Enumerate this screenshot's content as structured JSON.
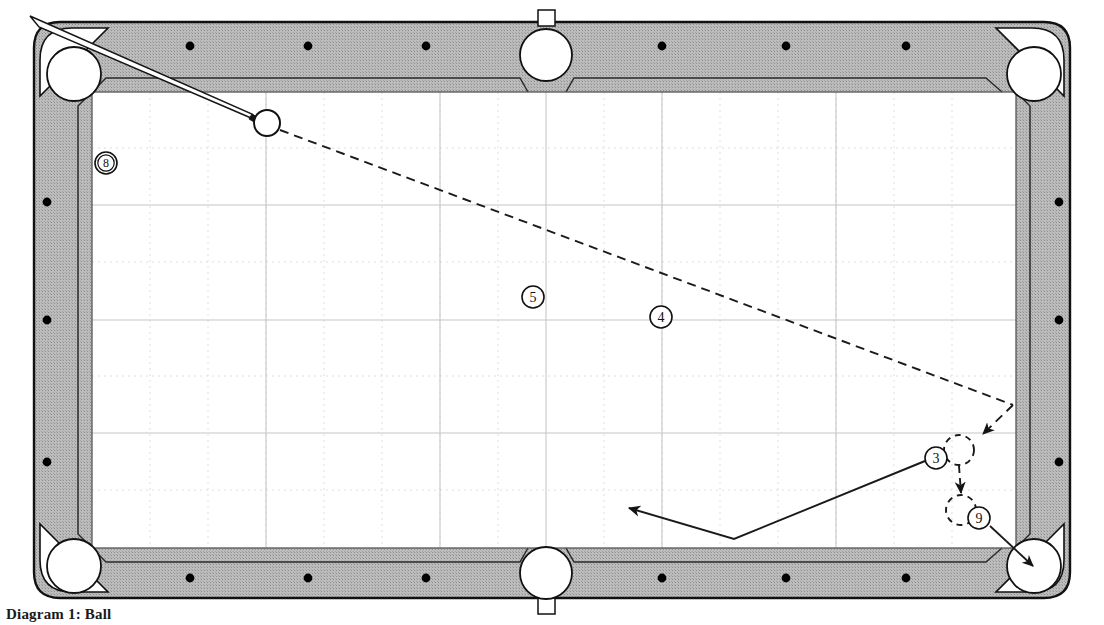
{
  "figure": {
    "caption": "Diagram 1: Ball",
    "kind": "pool-table-shot-diagram"
  },
  "colors": {
    "rail": "#b4b4b4",
    "rail_dark": "#9a9a9a",
    "outline": "#101010",
    "cloth": "#ffffff",
    "grid_major": "#c9c9c9",
    "grid_minor": "#dcdcdc",
    "path_solid": "#1a1a1a",
    "path_dashed": "#1a1a1a",
    "ball_fill": "#ffffff",
    "diamond": "#000000"
  },
  "table": {
    "name": "pool-table",
    "rail_diamonds_top": 6,
    "rail_diamonds_bottom": 6,
    "rail_diamonds_left": 3,
    "rail_diamonds_right": 3,
    "pockets": [
      {
        "id": "top-left",
        "label": "top-left-pocket",
        "cx": 74,
        "cy": 74
      },
      {
        "id": "top-middle",
        "label": "top-middle-pocket",
        "cx": 546,
        "cy": 55
      },
      {
        "id": "top-right",
        "label": "top-right-pocket",
        "cx": 1034,
        "cy": 74
      },
      {
        "id": "bottom-left",
        "label": "bottom-left-pocket",
        "cx": 74,
        "cy": 566
      },
      {
        "id": "bottom-middle",
        "label": "bottom-middle-pocket",
        "cx": 546,
        "cy": 573
      },
      {
        "id": "bottom-right",
        "label": "bottom-right-pocket",
        "cx": 1034,
        "cy": 566
      }
    ]
  },
  "balls": [
    {
      "id": "cue",
      "label": "",
      "name": "cue-ball",
      "cx": 267,
      "cy": 123,
      "r": 13,
      "style": "solid-open"
    },
    {
      "id": "8",
      "label": "8",
      "name": "ball-label-8",
      "cx": 106,
      "cy": 163,
      "r": 11,
      "style": "numbered"
    },
    {
      "id": "5",
      "label": "5",
      "name": "ball-label-5",
      "cx": 533,
      "cy": 297,
      "r": 11,
      "style": "numbered"
    },
    {
      "id": "4",
      "label": "4",
      "name": "ball-label-4",
      "cx": 661,
      "cy": 317,
      "r": 11,
      "style": "numbered"
    },
    {
      "id": "3",
      "label": "3",
      "name": "ball-label-3",
      "cx": 936,
      "cy": 458,
      "r": 11,
      "style": "numbered"
    },
    {
      "id": "9",
      "label": "9",
      "name": "ball-label-9",
      "cx": 979,
      "cy": 518,
      "r": 11,
      "style": "numbered"
    }
  ],
  "ghost_balls": [
    {
      "name": "ghost-ball-3-contact",
      "cx": 959,
      "cy": 450,
      "r": 15
    },
    {
      "name": "ghost-ball-3-landing",
      "cx": 961,
      "cy": 510,
      "r": 15
    }
  ],
  "cue_stick": {
    "name": "cue-stick",
    "butt_x": 34,
    "butt_y": 20,
    "tip_x": 252,
    "tip_y": 117,
    "butt_width": 11,
    "tip_width": 3
  },
  "paths": {
    "cue_ball_dashed": {
      "name": "cue-ball-path",
      "style": "dashed",
      "points": [
        [
          278,
          128
        ],
        [
          1013,
          405
        ],
        [
          980,
          437
        ]
      ],
      "arrow_at_end": true
    },
    "object_ball_dashed": {
      "name": "three-ball-path",
      "style": "dashed",
      "points": [
        [
          959,
          466
        ],
        [
          961,
          495
        ]
      ],
      "arrow_at_end": true
    },
    "cue_ball_tangent": {
      "name": "cue-ball-tangent-path",
      "style": "solid",
      "points": [
        [
          925,
          461
        ],
        [
          734,
          539
        ],
        [
          626,
          506
        ]
      ],
      "arrow_at_end": true
    },
    "nine_ball_to_pocket": {
      "name": "nine-ball-path",
      "style": "solid",
      "points": [
        [
          990,
          525
        ],
        [
          1036,
          567
        ]
      ],
      "arrow_at_end": true
    }
  }
}
